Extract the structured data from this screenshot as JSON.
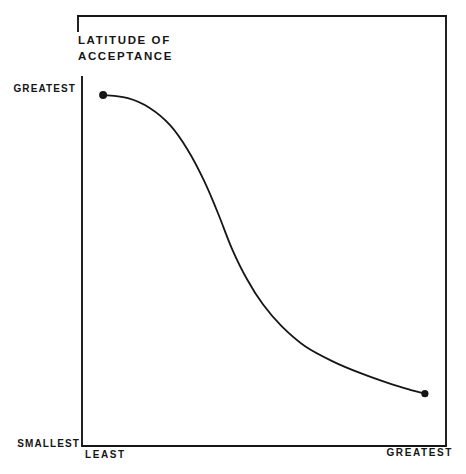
{
  "figure": {
    "title_line1": "LATITUDE OF",
    "title_line2": "ACCEPTANCE",
    "y_axis": {
      "top_label": "GREATEST",
      "bottom_label": "SMALLEST"
    },
    "x_axis": {
      "left_label": "LEAST",
      "right_label": "GREATEST"
    }
  },
  "colors": {
    "ink": "#161616",
    "background": "#ffffff"
  },
  "chart_data": {
    "type": "line",
    "title": "LATITUDE OF ACCEPTANCE",
    "xlabel": "",
    "ylabel": "LATITUDE OF ACCEPTANCE",
    "x_tick_labels": [
      "LEAST",
      "GREATEST"
    ],
    "y_tick_labels": [
      "SMALLEST",
      "GREATEST"
    ],
    "x_range": [
      0,
      1
    ],
    "y_range": [
      0,
      1
    ],
    "grid": false,
    "legend": null,
    "style": "scanned black-and-white book figure, decreasing S-curve with filled dots at both endpoints",
    "series": [
      {
        "name": "latitude-of-acceptance-curve",
        "marker_at_endpoints": true,
        "points_norm": [
          [
            0.058,
            0.986
          ],
          [
            0.126,
            0.977
          ],
          [
            0.187,
            0.949
          ],
          [
            0.242,
            0.901
          ],
          [
            0.291,
            0.831
          ],
          [
            0.335,
            0.746
          ],
          [
            0.374,
            0.653
          ],
          [
            0.412,
            0.554
          ],
          [
            0.453,
            0.469
          ],
          [
            0.497,
            0.398
          ],
          [
            0.549,
            0.336
          ],
          [
            0.613,
            0.28
          ],
          [
            0.69,
            0.237
          ],
          [
            0.769,
            0.203
          ],
          [
            0.846,
            0.175
          ],
          [
            0.901,
            0.158
          ],
          [
            0.942,
            0.147
          ]
        ]
      }
    ]
  }
}
